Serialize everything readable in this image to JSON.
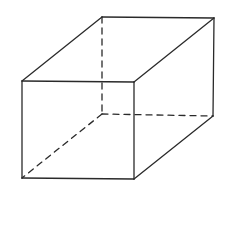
{
  "diagram": {
    "colors": {
      "background": "#ffffff",
      "line": "#2a2a2a"
    },
    "vertices": {
      "front_top_left": [
        22,
        81
      ],
      "front_top_right": [
        134,
        82
      ],
      "front_bottom_left": [
        22,
        178
      ],
      "front_bottom_right": [
        134,
        179
      ],
      "back_top_left": [
        102,
        17
      ],
      "back_top_right": [
        214,
        18
      ],
      "back_bottom_left": [
        102,
        114
      ],
      "back_bottom_right": [
        213,
        116
      ]
    },
    "visible_edges": [
      [
        "front_top_left",
        "front_top_right"
      ],
      [
        "front_top_right",
        "front_bottom_right"
      ],
      [
        "front_bottom_right",
        "front_bottom_left"
      ],
      [
        "front_bottom_left",
        "front_top_left"
      ],
      [
        "front_top_left",
        "back_top_left"
      ],
      [
        "back_top_left",
        "back_top_right"
      ],
      [
        "back_top_right",
        "front_top_right"
      ],
      [
        "back_top_right",
        "back_bottom_right"
      ],
      [
        "back_bottom_right",
        "front_bottom_right"
      ]
    ],
    "hidden_edges": [
      [
        "back_top_left",
        "back_bottom_left"
      ],
      [
        "back_bottom_left",
        "back_bottom_right"
      ],
      [
        "back_bottom_left",
        "front_bottom_left"
      ]
    ]
  }
}
